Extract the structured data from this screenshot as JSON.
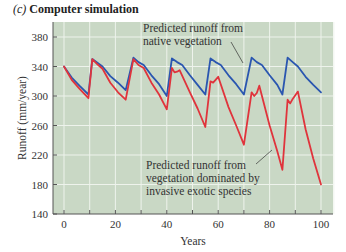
{
  "figure": {
    "panel_label": "(c)",
    "title": "Computer simulation"
  },
  "colors": {
    "plot_background": "#c9d8c5",
    "grid": "#eef3ec",
    "native": "#2a56b0",
    "invasive": "#e0343c",
    "axis": "#555555"
  },
  "chart_data": {
    "type": "line",
    "title": "Computer simulation",
    "xlabel": "Years",
    "ylabel": "Runoff (mm/year)",
    "xlim": [
      -4,
      105
    ],
    "ylim": [
      140,
      400
    ],
    "xticks": [
      0,
      20,
      40,
      60,
      80,
      100
    ],
    "yticks": [
      140,
      180,
      220,
      260,
      300,
      340,
      380
    ],
    "grid": true,
    "grid_x_step": 10,
    "legend": "annotations",
    "series": [
      {
        "name": "Predicted runoff from native vegetation",
        "color": "#2a56b0",
        "x": [
          0,
          3,
          6,
          9.5,
          11,
          13,
          15,
          18,
          21,
          24,
          27,
          29,
          31,
          34,
          37,
          40,
          42,
          44,
          46,
          49,
          52,
          55,
          57,
          59,
          61,
          64,
          67,
          70,
          73,
          75,
          77,
          80,
          83,
          85,
          87,
          89,
          91,
          94,
          97,
          100
        ],
        "values": [
          340,
          325,
          314,
          302,
          350,
          345,
          340,
          327,
          318,
          308,
          352,
          346,
          342,
          328,
          316,
          300,
          351,
          346,
          342,
          328,
          315,
          302,
          351,
          346,
          342,
          328,
          316,
          302,
          352,
          346,
          342,
          328,
          315,
          302,
          352,
          346,
          340,
          326,
          315,
          305
        ]
      },
      {
        "name": "Predicted runoff from vegetation dominated by invasive exotic species",
        "color": "#e0343c",
        "x": [
          0,
          3,
          6,
          9.5,
          11,
          13,
          15,
          18,
          21,
          24,
          27,
          29,
          31,
          34,
          37,
          40,
          42,
          43,
          44,
          45,
          49,
          52,
          55,
          57,
          58,
          59,
          60,
          64,
          67,
          70,
          73,
          74,
          75,
          76,
          80,
          83,
          85,
          87,
          88,
          89,
          91,
          94,
          97,
          100
        ],
        "values": [
          340,
          322,
          310,
          297,
          350,
          343,
          337,
          318,
          305,
          295,
          350,
          342,
          338,
          318,
          302,
          282,
          338,
          332,
          333,
          335,
          305,
          283,
          258,
          320,
          318,
          322,
          326,
          285,
          260,
          234,
          305,
          300,
          304,
          314,
          260,
          225,
          200,
          295,
          290,
          296,
          306,
          255,
          215,
          180
        ]
      }
    ],
    "annotations": [
      {
        "text": "Predicted runoff from native vegetation",
        "target_series": 0
      },
      {
        "text": "Predicted runoff from vegetation dominated by invasive exotic species",
        "target_series": 1
      }
    ]
  },
  "annotations": {
    "native_line1": "Predicted runoff from",
    "native_line2": "native vegetation",
    "invasive_line1": "Predicted runoff from",
    "invasive_line2": "vegetation dominated by",
    "invasive_line3": "invasive exotic species"
  }
}
